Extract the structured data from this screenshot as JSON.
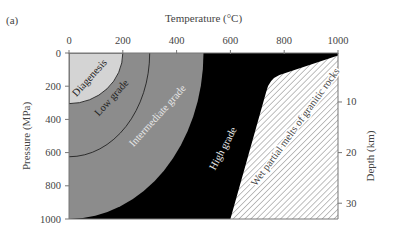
{
  "panel_label": "(a)",
  "chart_data": {
    "type": "area",
    "title": "",
    "xlabel": "Temperature (°C)",
    "ylabel": "Pressure (MPa)",
    "y2label": "Depth (km)",
    "xlim": [
      0,
      1000
    ],
    "ylim": [
      0,
      1000
    ],
    "y_inverted": true,
    "x_ticks": [
      "0",
      "200",
      "400",
      "600",
      "800",
      "1000"
    ],
    "x_tick_values": [
      0,
      200,
      400,
      600,
      800,
      1000
    ],
    "y_ticks": [
      "0",
      "200",
      "400",
      "600",
      "800",
      "1000"
    ],
    "y_tick_values": [
      0,
      200,
      400,
      600,
      800,
      1000
    ],
    "y2_ticks": [
      "10",
      "20",
      "30"
    ],
    "y2_tick_values_pressure": [
      295,
      600,
      905
    ],
    "grid": false,
    "regions": [
      {
        "name": "Diagenesis",
        "fill": "#d4d4d4",
        "boundary": {
          "top_T": 200,
          "left_P": 305
        }
      },
      {
        "name": "Low grade",
        "fill": "#8c8c8c",
        "boundary": {
          "top_T": 300,
          "left_P": 625
        }
      },
      {
        "name": "Intermediate grade",
        "fill": "#8c8c8c",
        "boundary": {
          "top_T": 500,
          "left_P": 1000
        }
      },
      {
        "name": "High grade",
        "fill": "#000000"
      },
      {
        "name": "Wet partial melts of granitic rocks",
        "fill": "hatched",
        "polygon": [
          [
            1000,
            15
          ],
          [
            760,
            145
          ],
          [
            600,
            1000
          ],
          [
            1000,
            1000
          ]
        ]
      }
    ]
  }
}
